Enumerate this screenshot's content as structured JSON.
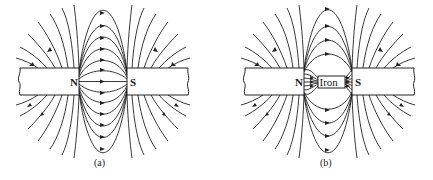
{
  "figure": {
    "panels": [
      {
        "id": "a",
        "caption": "(a)",
        "left_pole_label": "N",
        "right_pole_label": "S",
        "description": "Magnetic field lines between N and S pole faces in air; lines run from N to S with arrows"
      },
      {
        "id": "b",
        "caption": "(b)",
        "left_pole_label": "N",
        "right_pole_label": "S",
        "insert_label": "Iron",
        "description": "Magnetic field lines between N and S poles with an iron piece in the gap; field lines concentrate into the iron"
      }
    ],
    "colors": {
      "line": "#222222",
      "magnet_fill": "#ffffff",
      "background": "#ffffff"
    }
  }
}
